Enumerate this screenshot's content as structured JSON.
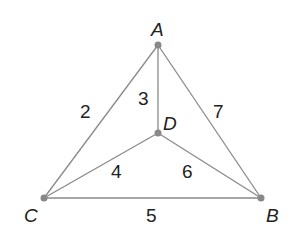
{
  "graph": {
    "vertices": [
      {
        "id": "A",
        "label": "A",
        "x": 158,
        "y": 45
      },
      {
        "id": "D",
        "label": "D",
        "x": 158,
        "y": 133
      },
      {
        "id": "C",
        "label": "C",
        "x": 44,
        "y": 198
      },
      {
        "id": "B",
        "label": "B",
        "x": 261,
        "y": 198
      }
    ],
    "edges": [
      {
        "from": "A",
        "to": "C",
        "weight": "2"
      },
      {
        "from": "A",
        "to": "D",
        "weight": "3"
      },
      {
        "from": "A",
        "to": "B",
        "weight": "7"
      },
      {
        "from": "C",
        "to": "D",
        "weight": "4"
      },
      {
        "from": "D",
        "to": "B",
        "weight": "6"
      },
      {
        "from": "C",
        "to": "B",
        "weight": "5"
      }
    ],
    "colors": {
      "edge": "#8a8a8a",
      "node": "#888888",
      "text": "#222222"
    }
  }
}
